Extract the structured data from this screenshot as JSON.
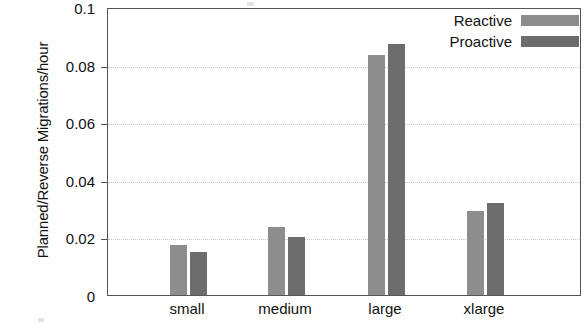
{
  "chart_data": {
    "type": "bar",
    "title": "",
    "xlabel": "",
    "ylabel": "Planned/Reverse Migrations/hour",
    "categories": [
      "small",
      "medium",
      "large",
      "xlarge"
    ],
    "series": [
      {
        "name": "Reactive",
        "color": "#8d8d8d",
        "values": [
          0.0175,
          0.0237,
          0.0835,
          0.0293
        ]
      },
      {
        "name": "Proactive",
        "color": "#6d6d6d",
        "values": [
          0.0148,
          0.02,
          0.0872,
          0.032
        ]
      }
    ],
    "ylim": [
      0,
      0.1
    ],
    "yticks": [
      0,
      0.02,
      0.04,
      0.06,
      0.08,
      0.1
    ],
    "ytick_labels": [
      "0",
      "0.02",
      "0.04",
      "0.06",
      "0.08",
      "0.1"
    ],
    "grid": "horizontal-dotted",
    "legend_position": "top-right",
    "legend_entries": [
      "Reactive",
      "Proactive"
    ]
  }
}
